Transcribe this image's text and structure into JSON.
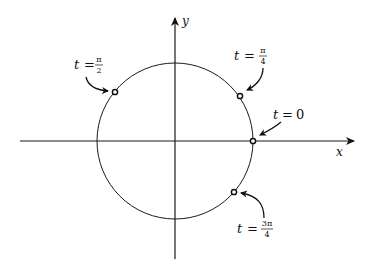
{
  "diagram": {
    "type": "parametric-circle",
    "axes": {
      "x_label": "x",
      "y_label": "y"
    },
    "circle": {
      "center": [
        175,
        141
      ],
      "radius": 78
    },
    "points": [
      {
        "id": "t0",
        "label_t": "t",
        "label_eq": "=",
        "value_text": "0",
        "fraction": false,
        "pos": [
          253,
          141
        ]
      },
      {
        "id": "t_pi4",
        "label_t": "t",
        "label_eq": "=",
        "num": "π",
        "den": "4",
        "fraction": true,
        "pos": [
          240,
          96
        ]
      },
      {
        "id": "t_pi2",
        "label_t": "t",
        "label_eq": "=",
        "num": "π",
        "den": "2",
        "fraction": true,
        "pos": [
          115,
          92
        ]
      },
      {
        "id": "t_3pi4",
        "label_t": "t",
        "label_eq": "=",
        "num": "3π",
        "den": "4",
        "fraction": true,
        "pos": [
          234,
          192
        ]
      }
    ],
    "colors": {
      "stroke": "#1a1a1a",
      "background": "#ffffff"
    }
  }
}
